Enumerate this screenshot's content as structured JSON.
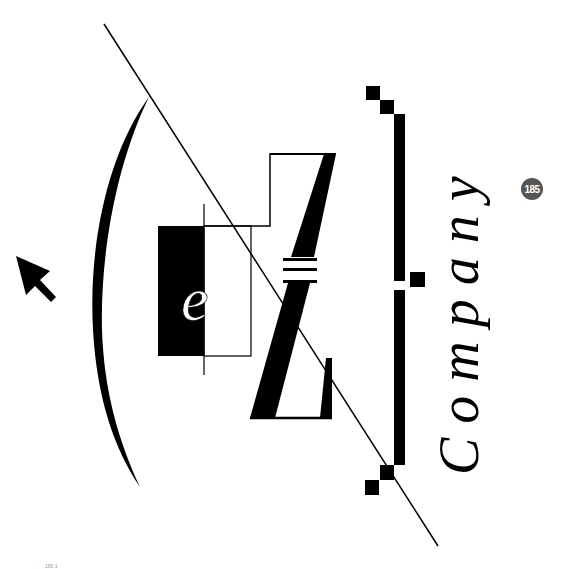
{
  "logo": {
    "brand_letter_small": "e",
    "brand_letter_large": "Z",
    "company_text": "Company",
    "colors": {
      "ink": "#000000",
      "paper": "#ffffff"
    }
  },
  "page_badge": {
    "number": "185",
    "color": "#555555"
  },
  "footer": {
    "mark": "185 1"
  },
  "icons": {
    "cursor": "arrow-pointer-icon"
  }
}
